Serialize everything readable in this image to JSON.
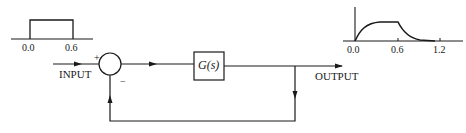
{
  "diagram": {
    "type": "feedback-control-block-diagram",
    "input_label": "INPUT",
    "output_label": "OUTPUT",
    "block_label": "G(s)",
    "summing_junction": {
      "plus_sign": "+",
      "minus_sign": "−"
    },
    "input_plot": {
      "description": "rectangular pulse",
      "ticks": [
        "0.0",
        "0.6"
      ]
    },
    "output_plot": {
      "description": "first-order rise then decay response",
      "ticks": [
        "0.0",
        "0.6",
        "1.2"
      ]
    },
    "line_color": "#1a1a1a"
  }
}
